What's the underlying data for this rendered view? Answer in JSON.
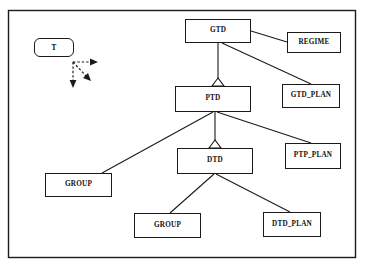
{
  "diagram": {
    "type": "class-hierarchy",
    "title": "",
    "frame": {
      "x": 8,
      "y": 10,
      "width": 348,
      "height": 248,
      "stroke": "#1b1b1b"
    },
    "colors": {
      "line": "#1b1b1b",
      "box_border": "#1b1b1b",
      "box_fill": "#ffffff",
      "background": "#ffffff",
      "text": "#111111"
    },
    "legend": {
      "label": "T",
      "shape": "rounded-rectangle",
      "arrows": [
        {
          "name": "arrow-right",
          "direction": "right",
          "style": "dashed"
        },
        {
          "name": "arrow-diagonal-down-right",
          "direction": "down-right",
          "style": "dashed"
        },
        {
          "name": "arrow-down",
          "direction": "down",
          "style": "dashed"
        }
      ]
    },
    "nodes": [
      {
        "id": "gtd",
        "label": "GTD",
        "x": 185,
        "y": 19,
        "width": 66,
        "height": 24
      },
      {
        "id": "regime",
        "label": "REGIME",
        "x": 287,
        "y": 32,
        "width": 54,
        "height": 21
      },
      {
        "id": "gtd_plan",
        "label": "GTD_PLAN",
        "x": 282,
        "y": 84,
        "width": 58,
        "height": 24
      },
      {
        "id": "ptd",
        "label": "PTD",
        "x": 175,
        "y": 86,
        "width": 76,
        "height": 26
      },
      {
        "id": "ptp_plan",
        "label": "PTP_PLAN",
        "x": 285,
        "y": 143,
        "width": 56,
        "height": 26
      },
      {
        "id": "dtd",
        "label": "DTD",
        "x": 177,
        "y": 148,
        "width": 76,
        "height": 26
      },
      {
        "id": "group_left",
        "label": "GROUP",
        "x": 45,
        "y": 173,
        "width": 67,
        "height": 24
      },
      {
        "id": "group_bottom",
        "label": "GROUP",
        "x": 134,
        "y": 213,
        "width": 67,
        "height": 25
      },
      {
        "id": "dtd_plan",
        "label": "DTD_PLAN",
        "x": 263,
        "y": 212,
        "width": 58,
        "height": 25
      }
    ],
    "edges": [
      {
        "from": "gtd",
        "to": "ptd",
        "kind": "generalization",
        "marker": "triangle"
      },
      {
        "from": "gtd",
        "to": "regime",
        "kind": "association",
        "marker": "none"
      },
      {
        "from": "gtd",
        "to": "gtd_plan",
        "kind": "association",
        "marker": "none"
      },
      {
        "from": "ptd",
        "to": "dtd",
        "kind": "generalization",
        "marker": "triangle"
      },
      {
        "from": "ptd",
        "to": "group_left",
        "kind": "association",
        "marker": "none"
      },
      {
        "from": "ptd",
        "to": "ptp_plan",
        "kind": "association",
        "marker": "none"
      },
      {
        "from": "dtd",
        "to": "group_bottom",
        "kind": "association",
        "marker": "none"
      },
      {
        "from": "dtd",
        "to": "dtd_plan",
        "kind": "association",
        "marker": "none"
      }
    ]
  }
}
